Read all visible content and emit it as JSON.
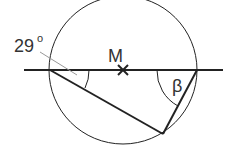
{
  "diagram": {
    "type": "circle-geometry",
    "labels": {
      "center": "M",
      "given_angle": "29",
      "degree_symbol": "o",
      "unknown_angle": "β"
    },
    "colors": {
      "stroke": "#222222",
      "leader": "#999999",
      "background": "#ffffff"
    },
    "elements": {
      "circle": {
        "cx": 123,
        "cy": 70,
        "r": 74
      },
      "diameter_line": {
        "x1": 24,
        "y1": 70,
        "x2": 223,
        "y2": 70
      },
      "chord_left": {
        "x1": 50,
        "y1": 70,
        "x2": 163,
        "y2": 134
      },
      "chord_right": {
        "x1": 163,
        "y1": 134,
        "x2": 197,
        "y2": 70
      },
      "center_mark": {
        "x": 123,
        "y": 70
      }
    }
  }
}
